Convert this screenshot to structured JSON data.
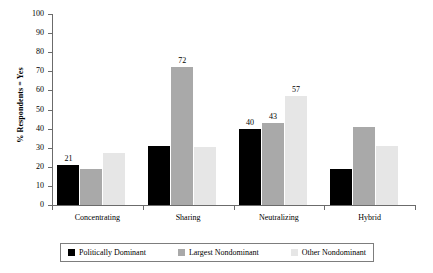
{
  "chart_data": {
    "type": "bar",
    "title": "",
    "subtitle": "",
    "xlabel": "",
    "ylabel": "% Respondents = Yes",
    "ylim": [
      0,
      100
    ],
    "ytick_step": 10,
    "yticks": [
      "100",
      "90",
      "80",
      "70",
      "60",
      "50",
      "40",
      "30",
      "20",
      "10",
      "0"
    ],
    "grid": false,
    "legend_position": "bottom",
    "categories": [
      "Concentrating",
      "Sharing",
      "Neutralizing",
      "Hybrid"
    ],
    "series": [
      {
        "name": "Politically Dominant",
        "color": "#000000",
        "values": [
          21,
          31,
          40,
          19
        ],
        "labels": [
          "21",
          "",
          "40",
          ""
        ]
      },
      {
        "name": "Largest Nondominant",
        "color": "#a9a9a9",
        "values": [
          19,
          72,
          43,
          41
        ],
        "labels": [
          "",
          "72",
          "43",
          ""
        ]
      },
      {
        "name": "Other Nondominant",
        "color": "#e6e6e6",
        "values": [
          27,
          30.5,
          57,
          31
        ],
        "labels": [
          "",
          "",
          "57",
          ""
        ]
      }
    ]
  }
}
